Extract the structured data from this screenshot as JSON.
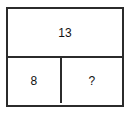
{
  "figure": {
    "type": "two-row-table-puzzle",
    "border_color": "#2b2b2b",
    "background_color": "#ffffff",
    "text_color": "#111111",
    "rows": [
      {
        "name": "top-row",
        "cells": [
          {
            "name": "top-cell",
            "value": "13"
          }
        ]
      },
      {
        "name": "bottom-row",
        "cells": [
          {
            "name": "bottom-left-cell",
            "value": "8"
          },
          {
            "name": "bottom-right-cell",
            "value": "?"
          }
        ]
      }
    ]
  }
}
